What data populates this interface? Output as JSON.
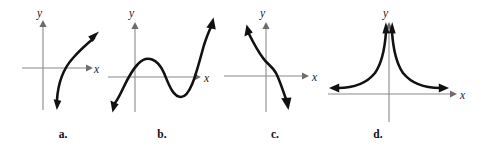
{
  "figure": {
    "type": "math-graph-panel-set",
    "background_color": "#ffffff",
    "axis_color": "#8a8a8a",
    "curve_color": "#111111",
    "panel_count": 4
  },
  "panels": [
    {
      "key": "a",
      "label": "a.",
      "x_axis_label": "x",
      "y_axis_label": "y",
      "description": "increasing concave-down curve rising left-to-right crossing the x-axis right of the origin, arrowheads at both ends",
      "curve_path": "M 56 105 C 58 86, 62 70, 72 58 C 80 48, 88 42, 96 37",
      "arrow_start": {
        "x": 56,
        "y": 105,
        "angle": 100
      },
      "arrow_end": {
        "x": 96,
        "y": 37,
        "angle": -35
      },
      "x_axis": {
        "x1": 22,
        "y1": 68,
        "x2": 88,
        "y2": 68
      },
      "y_axis": {
        "x1": 43,
        "y1": 110,
        "x2": 43,
        "y2": 22
      },
      "x_label_pos": {
        "x": 94,
        "y": 72
      },
      "y_label_pos": {
        "x": 38,
        "y": 18
      }
    },
    {
      "key": "b",
      "label": "b.",
      "x_axis_label": "x",
      "y_axis_label": "y",
      "description": "cubic polynomial with a local maximum left of the y-axis and a local minimum right of the y-axis, falling to lower-left and rising to upper-right",
      "curve_path": "M 12 108 C 20 96, 26 74, 38 62 C 48 52, 58 58, 64 72 C 70 86, 74 98, 82 98 C 92 98, 98 72, 106 44 C 110 34, 112 28, 114 24",
      "arrow_start": {
        "x": 12,
        "y": 108,
        "angle": 125
      },
      "arrow_end": {
        "x": 114,
        "y": 24,
        "angle": -70
      },
      "x_axis": {
        "x1": 4,
        "y1": 77,
        "x2": 98,
        "y2": 77
      },
      "y_axis": {
        "x1": 35,
        "y1": 112,
        "x2": 35,
        "y2": 22
      },
      "x_label_pos": {
        "x": 104,
        "y": 81
      },
      "y_label_pos": {
        "x": 30,
        "y": 18
      }
    },
    {
      "key": "c",
      "label": "c.",
      "x_axis_label": "x",
      "y_axis_label": "y",
      "description": "decreasing curve with an inflection point near the y-axis, arrow to upper-left and arrow to lower-right",
      "curve_path": "M 24 26 C 30 34, 34 44, 40 54 C 44 61, 50 65, 55 72 C 60 80, 62 90, 66 100",
      "arrow_start": {
        "x": 24,
        "y": 26,
        "angle": -122
      },
      "arrow_end": {
        "x": 66,
        "y": 100,
        "angle": 68
      },
      "x_axis": {
        "x1": 2,
        "y1": 76,
        "x2": 88,
        "y2": 76
      },
      "y_axis": {
        "x1": 44,
        "y1": 112,
        "x2": 44,
        "y2": 22
      },
      "x_label_pos": {
        "x": 94,
        "y": 80
      },
      "y_label_pos": {
        "x": 39,
        "y": 18
      }
    },
    {
      "key": "d",
      "label": "d.",
      "x_axis_label": "x",
      "y_axis_label": "y",
      "description": "even function with a vertical asymptote at the y-axis and a horizontal asymptote at the x-axis; both branches rise steeply toward the y-axis and flatten outward",
      "curve_path_left": "M 6 90 C 24 90, 38 86, 48 74 C 56 64, 60 48, 62 26",
      "curve_path_right": "M 118 90 C 100 90, 86 86, 76 74 C 68 64, 64 48, 62 26",
      "arrow_left_tip": {
        "x": 6,
        "y": 90,
        "angle": 180
      },
      "arrow_right_tip": {
        "x": 118,
        "y": 90,
        "angle": 0
      },
      "arrow_peak_left": {
        "x": 60,
        "y": 24,
        "angle": -86
      },
      "arrow_peak_right": {
        "x": 66,
        "y": 24,
        "angle": -94
      },
      "x_axis": {
        "x1": 2,
        "y1": 94,
        "x2": 126,
        "y2": 94
      },
      "y_axis": {
        "x1": 63,
        "y1": 120,
        "x2": 63,
        "y2": 22
      },
      "x_label_pos": {
        "x": 132,
        "y": 98
      },
      "y_label_pos": {
        "x": 58,
        "y": 18
      }
    }
  ]
}
